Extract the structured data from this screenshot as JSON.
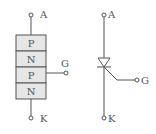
{
  "structure": {
    "layers": [
      {
        "label": "P"
      },
      {
        "label": "N"
      },
      {
        "label": "P"
      },
      {
        "label": "N"
      }
    ],
    "terminals": {
      "anode": "A",
      "gate": "G",
      "cathode": "K"
    }
  },
  "symbol": {
    "terminals": {
      "anode": "A",
      "gate": "G",
      "cathode": "K"
    }
  },
  "colors": {
    "stroke": "#555555",
    "layer_fill": "#e6e6e6"
  }
}
